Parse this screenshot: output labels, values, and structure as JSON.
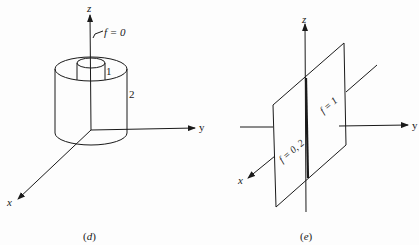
{
  "figures": [
    {
      "id": "d",
      "caption_letter": "d",
      "caption": "(d)",
      "axes": {
        "x": "x",
        "y": "y",
        "z": "z"
      },
      "labels": {
        "axis_condition": "f = 0",
        "inner_cylinder": "1",
        "outer_cylinder": "2"
      },
      "description": "Two coaxial cylinders about the z-axis; inner radius 1, outer radius 2; f = 0 on the z-axis"
    },
    {
      "id": "e",
      "caption_letter": "e",
      "caption": "(e)",
      "axes": {
        "x": "x",
        "y": "y",
        "z": "z"
      },
      "labels": {
        "plane_right": "f = 1",
        "plane_left": "f = 0, 2"
      },
      "description": "A plane containing the z-axis (x-z plane) crossing the y-axis; f = 1 on one side, f = 0, 2 on the other"
    }
  ],
  "colors": {
    "ink": "#1a1a1a",
    "background": "#fdfdfd"
  }
}
